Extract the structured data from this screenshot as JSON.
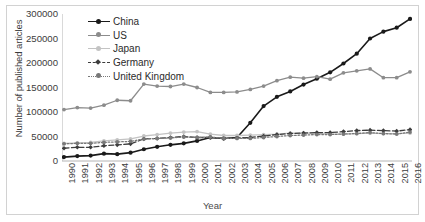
{
  "chart_data": {
    "type": "line",
    "title": "",
    "xlabel": "Year",
    "ylabel": "Number of published articles",
    "grid": false,
    "legend_position": "top-left",
    "xlim": [
      1990,
      2016
    ],
    "ylim": [
      0,
      300000
    ],
    "yticks": [
      0,
      50000,
      100000,
      150000,
      200000,
      250000,
      300000
    ],
    "ytick_labels": [
      "0",
      "50000",
      "100000",
      "150000",
      "200000",
      "250000",
      "300000"
    ],
    "categories": [
      1990,
      1991,
      1992,
      1993,
      1994,
      1995,
      1996,
      1997,
      1998,
      1999,
      2000,
      2001,
      2002,
      2003,
      2004,
      2005,
      2006,
      2007,
      2008,
      2009,
      2010,
      2011,
      2012,
      2013,
      2014,
      2015,
      2016
    ],
    "xtick_labels": [
      "1990",
      "1991",
      "1992",
      "1993",
      "1994",
      "1995",
      "1996",
      "1997",
      "1998",
      "1999",
      "2000",
      "2001",
      "2002",
      "2003",
      "2004",
      "2005",
      "2006",
      "2007",
      "2008",
      "2009",
      "2010",
      "2011",
      "2012",
      "2013",
      "2014",
      "2015",
      "2016"
    ],
    "series": [
      {
        "name": "China",
        "color": "#1a1a1a",
        "style": "solid",
        "marker": "circle",
        "values": [
          8000,
          10000,
          11000,
          15000,
          14000,
          17000,
          24000,
          29000,
          33000,
          36000,
          41000,
          48000,
          46000,
          48000,
          78000,
          112000,
          131000,
          142000,
          156000,
          168000,
          181000,
          199000,
          219000,
          250000,
          264000,
          272000,
          290000
        ]
      },
      {
        "name": "US",
        "color": "#8c8c8c",
        "style": "solid",
        "marker": "circle",
        "values": [
          105000,
          109000,
          108000,
          114000,
          124000,
          123000,
          157000,
          153000,
          152000,
          157000,
          150000,
          140000,
          140000,
          141000,
          146000,
          153000,
          164000,
          171000,
          169000,
          172000,
          167000,
          180000,
          184000,
          188000,
          170000,
          170000,
          182000
        ]
      },
      {
        "name": "Japan",
        "color": "#c3c3c3",
        "style": "solid",
        "marker": "circle",
        "values": [
          36000,
          37000,
          38000,
          41000,
          43000,
          45000,
          51000,
          54000,
          57000,
          59000,
          60000,
          55000,
          52000,
          52000,
          53000,
          54000,
          55000,
          57000,
          57000,
          57000,
          55000,
          55000,
          56000,
          57000,
          56000,
          56000,
          57000
        ]
      },
      {
        "name": "Germany",
        "color": "#3d3d3d",
        "style": "dashed",
        "marker": "diamond",
        "values": [
          26000,
          28000,
          28000,
          31000,
          33000,
          35000,
          45000,
          46000,
          48000,
          50000,
          48000,
          48000,
          46000,
          47000,
          48000,
          51000,
          54000,
          56000,
          57000,
          58000,
          58000,
          60000,
          62000,
          63000,
          62000,
          61000,
          64000
        ]
      },
      {
        "name": "United Kingdom",
        "color": "#787878",
        "style": "dotted",
        "marker": "circle",
        "values": [
          35000,
          36000,
          36000,
          38000,
          39000,
          40000,
          45000,
          46000,
          47000,
          49000,
          48000,
          49000,
          46000,
          46000,
          46000,
          48000,
          50000,
          52000,
          53000,
          54000,
          54000,
          55000,
          56000,
          58000,
          56000,
          55000,
          59000
        ]
      }
    ]
  }
}
